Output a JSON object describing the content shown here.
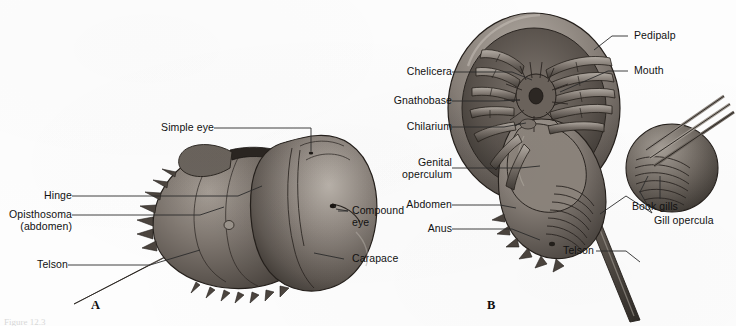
{
  "figure": {
    "background_color": "#fdfdfd",
    "label_color": "#111111",
    "leader_color": "#2b2b2b",
    "width": 736,
    "height": 326,
    "caption_fragment": "Figure 12.3"
  },
  "panels": [
    {
      "id": "A",
      "letter": "A",
      "view": "dorsal",
      "labels": [
        {
          "key": "simple_eye",
          "text": "Simple eye",
          "align": "right"
        },
        {
          "key": "hinge",
          "text": "Hinge",
          "align": "right"
        },
        {
          "key": "opisthosoma",
          "text": "Opisthosoma\n(abdomen)",
          "align": "right"
        },
        {
          "key": "telson",
          "text": "Telson",
          "align": "right"
        },
        {
          "key": "compound_eye",
          "text": "Compound\neye",
          "align": "left"
        },
        {
          "key": "carapace",
          "text": "Carapace",
          "align": "left"
        }
      ]
    },
    {
      "id": "B",
      "letter": "B",
      "view": "ventral",
      "labels": [
        {
          "key": "chelicera",
          "text": "Chelicera",
          "align": "right"
        },
        {
          "key": "gnathobase",
          "text": "Gnathobase",
          "align": "right"
        },
        {
          "key": "chilarium",
          "text": "Chilarium",
          "align": "right"
        },
        {
          "key": "genital_operculum",
          "text": "Genital\noperculum",
          "align": "right"
        },
        {
          "key": "abdomen",
          "text": "Abdomen",
          "align": "right"
        },
        {
          "key": "anus",
          "text": "Anus",
          "align": "right"
        },
        {
          "key": "telson",
          "text": "Telson",
          "align": "right"
        },
        {
          "key": "pedipalp",
          "text": "Pedipalp",
          "align": "left"
        },
        {
          "key": "mouth",
          "text": "Mouth",
          "align": "left"
        },
        {
          "key": "book_gills",
          "text": "Book gills",
          "align": "left"
        },
        {
          "key": "gill_opercula",
          "text": "Gill opercula",
          "align": "left"
        }
      ]
    }
  ],
  "palette": {
    "shell_dark": "#3b3732",
    "shell_mid": "#6d6660",
    "shell_light": "#9a938c",
    "shell_highlight": "#c3bdb6",
    "outline": "#241f1b",
    "telson": "#4a443e"
  }
}
